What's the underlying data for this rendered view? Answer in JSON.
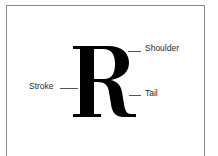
{
  "diagram": {
    "title_letter": "R",
    "labels": [
      {
        "id": "shoulder",
        "text": "Shoulder"
      },
      {
        "id": "stroke",
        "text": "Stroke"
      },
      {
        "id": "tail",
        "text": "Tail"
      }
    ],
    "colors": {
      "glyph": "#000000",
      "frame": "#8a8a8a",
      "label": "#2a2a2a",
      "leader": "#555555"
    }
  }
}
